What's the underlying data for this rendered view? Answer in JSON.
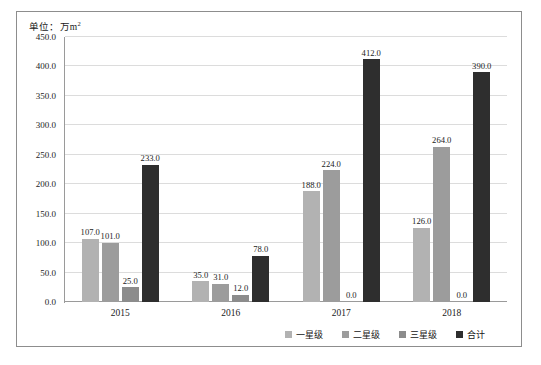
{
  "figure": {
    "unit_label": "单位：万m",
    "unit_superscript": "2"
  },
  "chart_data": {
    "type": "bar",
    "title": "",
    "xlabel": "",
    "ylabel": "单位：万m²",
    "ylim": [
      0,
      450
    ],
    "ytick_step": 50,
    "grid": true,
    "legend_position": "bottom-right",
    "categories": [
      "2015",
      "2016",
      "2017",
      "2018"
    ],
    "ytick_labels": [
      "450.0",
      "400.0",
      "350.0",
      "300.0",
      "250.0",
      "200.0",
      "150.0",
      "100.0",
      "50.0",
      "0.0"
    ],
    "ytick_values": [
      450,
      400,
      350,
      300,
      250,
      200,
      150,
      100,
      50,
      0
    ],
    "series": [
      {
        "name": "一星级",
        "color": "#b2b2b2",
        "values": [
          107.0,
          35.0,
          188.0,
          126.0
        ],
        "labels": [
          "107.0",
          "35.0",
          "188.0",
          "126.0"
        ]
      },
      {
        "name": "二星级",
        "color": "#9c9c9c",
        "values": [
          101.0,
          31.0,
          224.0,
          264.0
        ],
        "labels": [
          "101.0",
          "31.0",
          "224.0",
          "264.0"
        ]
      },
      {
        "name": "三星级",
        "color": "#8c8c8c",
        "values": [
          25.0,
          12.0,
          0.0,
          0.0
        ],
        "labels": [
          "25.0",
          "12.0",
          "0.0",
          "0.0"
        ]
      },
      {
        "name": "合计",
        "color": "#2e2e2e",
        "values": [
          233.0,
          78.0,
          412.0,
          390.0
        ],
        "labels": [
          "233.0",
          "78.0",
          "412.0",
          "390.0"
        ]
      }
    ]
  }
}
